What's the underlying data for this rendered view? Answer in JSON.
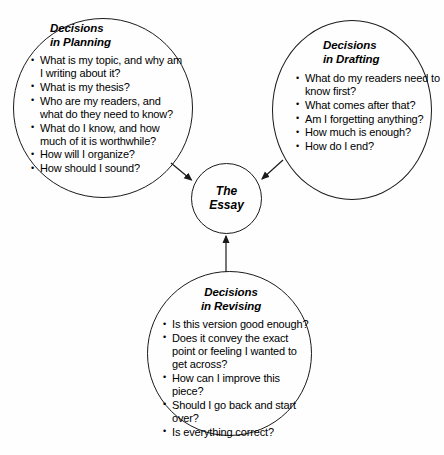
{
  "diagram": {
    "center": {
      "id": "the-essay",
      "title_lines": [
        "The",
        "Essay"
      ]
    },
    "nodes": [
      {
        "id": "planning",
        "title_lines": [
          "Decisions",
          "in Planning"
        ],
        "items": [
          "What is my topic, and why am I writing about it?",
          "What is my thesis?",
          "Who are my readers, and what do they need to know?",
          "What do I know, and how much of it is worthwhile?",
          "How will I organize?",
          "How should I sound?"
        ]
      },
      {
        "id": "drafting",
        "title_lines": [
          "Decisions",
          "in Drafting"
        ],
        "items": [
          "What do my readers need to know first?",
          "What comes after that?",
          "Am I forgetting anything?",
          "How much is enough?",
          "How do I end?"
        ]
      },
      {
        "id": "revising",
        "title_lines": [
          "Decisions",
          "in Revising"
        ],
        "items": [
          "Is this version good enough?",
          "Does it convey the exact point or feeling I wanted to get across?",
          "How can I improve this piece?",
          "Should I go back and start over?",
          "Is everything correct?"
        ]
      }
    ],
    "arrows": [
      {
        "id": "planning-to-essay",
        "from": "planning",
        "to": "the-essay"
      },
      {
        "id": "drafting-to-essay",
        "from": "drafting",
        "to": "the-essay"
      },
      {
        "id": "revising-to-essay",
        "from": "revising",
        "to": "the-essay"
      }
    ],
    "colors": {
      "stroke": "#1a1a1a",
      "text": "#000000",
      "background": "#ffffff"
    }
  }
}
